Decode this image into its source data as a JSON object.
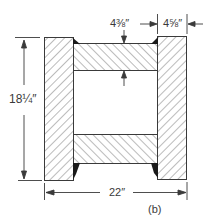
{
  "figure": {
    "label": "(b)"
  },
  "dimensions": {
    "height": "18¼″",
    "width": "22″",
    "flange_thickness": "4⅜″",
    "web_thickness": "4⅝″"
  },
  "colors": {
    "line": "#3a3a3a",
    "hatch": "#555555",
    "weld": "#1a1a1a",
    "background": "#ffffff"
  }
}
